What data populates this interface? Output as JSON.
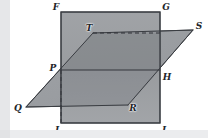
{
  "figure": {
    "type": "geometry-diagram",
    "canvas": {
      "width": 208,
      "height": 138
    },
    "colors": {
      "vertical_plane_fill": "#8f9296",
      "vertical_plane_fill_dark": "#7e8185",
      "horizontal_plane_fill": "#9a9da1",
      "overlap_fill": "#86898d",
      "stroke": "#3a3d42",
      "dashed_stroke": "#2e3136",
      "label_color": "#23262b",
      "background": "#ffffff",
      "margin_band": "#e6e7e9"
    },
    "vertical_plane": {
      "name": "rectangle-FGIJ",
      "vertices": [
        "F",
        "G",
        "I",
        "J"
      ],
      "points": [
        [
          61,
          12
        ],
        [
          160,
          12
        ],
        [
          160,
          123
        ],
        [
          61,
          123
        ]
      ]
    },
    "horizontal_plane": {
      "name": "parallelogram-QTSR",
      "vertices": [
        "Q",
        "T",
        "S",
        "R"
      ],
      "points": [
        [
          26,
          107
        ],
        [
          93,
          33
        ],
        [
          193,
          30
        ],
        [
          128,
          105
        ]
      ]
    },
    "intersection_segment": {
      "name": "segment-PH",
      "from": "P",
      "to": "H",
      "points": [
        [
          61,
          70
        ],
        [
          160,
          70
        ]
      ]
    },
    "dashed_segments": [
      {
        "name": "segment-T-to-G-edge",
        "points": [
          [
            93,
            33
          ],
          [
            160,
            33
          ]
        ]
      },
      {
        "name": "segment-P-to-J-edge",
        "points": [
          [
            61,
            70
          ],
          [
            61,
            123
          ]
        ]
      }
    ],
    "solid_segments": [
      {
        "name": "segment-Q-to-T",
        "points": [
          [
            26,
            107
          ],
          [
            93,
            33
          ]
        ]
      },
      {
        "name": "segment-Q-to-R",
        "points": [
          [
            26,
            107
          ],
          [
            128,
            105
          ]
        ]
      },
      {
        "name": "segment-R-to-S",
        "points": [
          [
            128,
            105
          ],
          [
            193,
            30
          ]
        ]
      },
      {
        "name": "segment-T-to-S",
        "points": [
          [
            93,
            33
          ],
          [
            193,
            30
          ]
        ]
      }
    ],
    "labels": [
      {
        "id": "F",
        "text": "F",
        "x": 56,
        "y": 7,
        "anchor": "corner-top-left"
      },
      {
        "id": "G",
        "text": "G",
        "x": 166,
        "y": 7,
        "anchor": "corner-top-right"
      },
      {
        "id": "T",
        "text": "T",
        "x": 89,
        "y": 28,
        "anchor": "plane-vertex-back-left"
      },
      {
        "id": "S",
        "text": "S",
        "x": 199,
        "y": 26,
        "anchor": "plane-vertex-back-right"
      },
      {
        "id": "P",
        "text": "P",
        "x": 53,
        "y": 68,
        "anchor": "intersection-left"
      },
      {
        "id": "H",
        "text": "H",
        "x": 167,
        "y": 77,
        "anchor": "intersection-right"
      },
      {
        "id": "Q",
        "text": "Q",
        "x": 18,
        "y": 108,
        "anchor": "plane-vertex-front-left"
      },
      {
        "id": "R",
        "text": "R",
        "x": 133,
        "y": 108,
        "anchor": "plane-vertex-front-right"
      },
      {
        "id": "J",
        "text": "J",
        "x": 57,
        "y": 130,
        "anchor": "corner-bottom-left"
      },
      {
        "id": "I",
        "text": "I",
        "x": 164,
        "y": 130,
        "anchor": "corner-bottom-right"
      }
    ]
  }
}
